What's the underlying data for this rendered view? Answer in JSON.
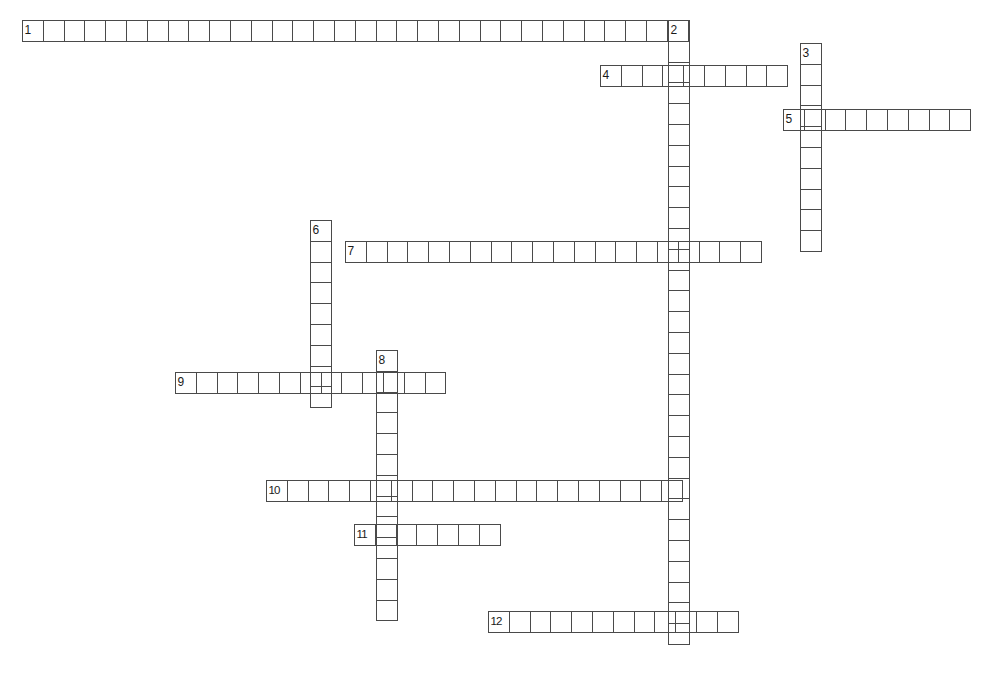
{
  "puzzle": {
    "title": "Crossword Puzzle Grid",
    "cell_size": 21.8,
    "grid_color": "#4a4a4a",
    "background_color": "#ffffff",
    "number_color": "#1a1a1a",
    "canvas": {
      "width": 1000,
      "height": 697
    },
    "entries": [
      {
        "number": "1",
        "direction": "across",
        "length": 32,
        "x": 22,
        "y": 20,
        "cells": [
          "",
          "",
          "",
          "",
          "",
          "",
          "",
          "",
          "",
          "",
          "",
          "",
          "",
          "",
          "",
          "",
          "",
          "",
          "",
          "",
          "",
          "",
          "",
          "",
          "",
          "",
          "",
          "",
          "",
          "",
          "",
          ""
        ]
      },
      {
        "number": "2",
        "direction": "down",
        "length": 30,
        "x": 668,
        "y": 20,
        "cells": [
          "",
          "",
          "",
          "",
          "",
          "",
          "",
          "",
          "",
          "",
          "",
          "",
          "",
          "",
          "",
          "",
          "",
          "",
          "",
          "",
          "",
          "",
          "",
          "",
          "",
          "",
          "",
          "",
          "",
          ""
        ]
      },
      {
        "number": "3",
        "direction": "down",
        "length": 10,
        "x": 800,
        "y": 43,
        "cells": [
          "",
          "",
          "",
          "",
          "",
          "",
          "",
          "",
          "",
          ""
        ]
      },
      {
        "number": "4",
        "direction": "across",
        "length": 9,
        "x": 600,
        "y": 65,
        "cells": [
          "",
          "",
          "",
          "",
          "",
          "",
          "",
          "",
          ""
        ]
      },
      {
        "number": "5",
        "direction": "across",
        "length": 9,
        "x": 783,
        "y": 109,
        "cells": [
          "",
          "",
          "",
          "",
          "",
          "",
          "",
          "",
          ""
        ]
      },
      {
        "number": "6",
        "direction": "down",
        "length": 9,
        "x": 310,
        "y": 220,
        "cells": [
          "",
          "",
          "",
          "",
          "",
          "",
          "",
          "",
          ""
        ]
      },
      {
        "number": "7",
        "direction": "across",
        "length": 20,
        "x": 345,
        "y": 241,
        "cells": [
          "",
          "",
          "",
          "",
          "",
          "",
          "",
          "",
          "",
          "",
          "",
          "",
          "",
          "",
          "",
          "",
          "",
          "",
          "",
          ""
        ]
      },
      {
        "number": "8",
        "direction": "down",
        "length": 13,
        "x": 376,
        "y": 350,
        "cells": [
          "",
          "",
          "",
          "",
          "",
          "",
          "",
          "",
          "",
          "",
          "",
          "",
          ""
        ]
      },
      {
        "number": "9",
        "direction": "across",
        "length": 13,
        "x": 175,
        "y": 372,
        "cells": [
          "",
          "",
          "",
          "",
          "",
          "",
          "",
          "",
          "",
          "",
          "",
          "",
          ""
        ]
      },
      {
        "number": "10",
        "direction": "across",
        "length": 20,
        "x": 266,
        "y": 480,
        "cells": [
          "",
          "",
          "",
          "",
          "",
          "",
          "",
          "",
          "",
          "",
          "",
          "",
          "",
          "",
          "",
          "",
          "",
          "",
          "",
          ""
        ]
      },
      {
        "number": "11",
        "direction": "across",
        "length": 7,
        "x": 354,
        "y": 524,
        "cells": [
          "",
          "",
          "",
          "",
          "",
          "",
          ""
        ]
      },
      {
        "number": "12",
        "direction": "across",
        "length": 12,
        "x": 488,
        "y": 611,
        "cells": [
          "",
          "",
          "",
          "",
          "",
          "",
          "",
          "",
          "",
          "",
          "",
          ""
        ]
      }
    ]
  }
}
